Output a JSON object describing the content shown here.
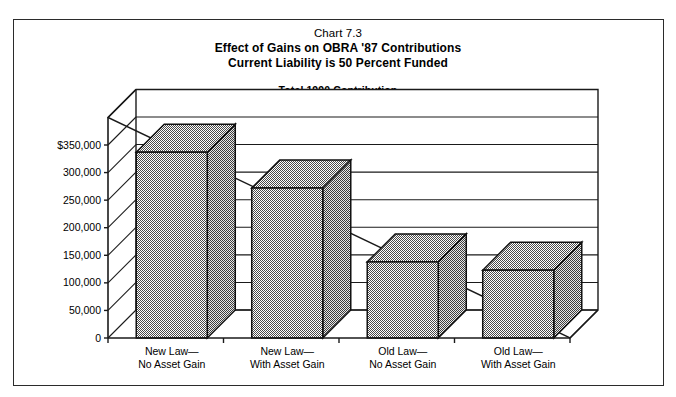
{
  "chart_data": {
    "type": "bar",
    "title": "Chart 7.3",
    "title_line2": "Effect of Gains on OBRA '87 Contributions",
    "title_line3": "Current Liability is 50 Percent Funded",
    "subtitle_line1": "Total 1990 Contribution",
    "subtitle_line2": "Non-Steel Plan with Only New Unfunded Liability",
    "xlabel": "",
    "ylabel": "",
    "categories": [
      "New Law—\nNo Asset Gain",
      "New Law—\nWith Asset Gain",
      "Old Law—\nNo Asset Gain",
      "Old Law—\nWith Asset Gain"
    ],
    "category_lines": [
      [
        "New Law—",
        "No Asset Gain"
      ],
      [
        "New Law—",
        "With Asset Gain"
      ],
      [
        "Old Law—",
        "No Asset Gain"
      ],
      [
        "Old Law—",
        "With Asset Gain"
      ]
    ],
    "values": [
      337000,
      272000,
      138000,
      123000
    ],
    "ylim": [
      0,
      400000
    ],
    "ytick_values": [
      0,
      50000,
      100000,
      150000,
      200000,
      250000,
      300000,
      350000
    ],
    "ytick_labels": [
      "0",
      "50,000",
      "100,000",
      "150,000",
      "200,000",
      "250,000",
      "300,000",
      "$350,000"
    ],
    "grid": true,
    "legend": null,
    "three_d": true,
    "bar_fill_color": "#9a9a9a",
    "bar_side_color": "#8a8a8a",
    "bar_edge_color": "#111111",
    "axis_color": "#1a1a1a",
    "background_color": "#ffffff",
    "border_color": "#2b2b2b"
  }
}
